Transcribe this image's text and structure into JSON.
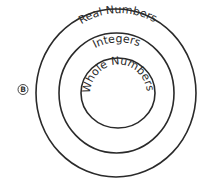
{
  "choice_label": "B",
  "diagram": {
    "type": "nested-circles",
    "sets": [
      {
        "label": "Real Numbers",
        "level": "outer"
      },
      {
        "label": "Integers",
        "level": "middle"
      },
      {
        "label": "Whole Numbers",
        "level": "inner"
      }
    ]
  },
  "colors": {
    "stroke": "#2a2a2a",
    "background": "#ffffff"
  }
}
